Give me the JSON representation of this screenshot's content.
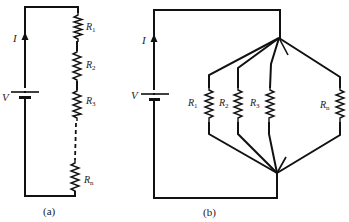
{
  "diagram": {
    "type": "circuit",
    "panels": [
      {
        "id": "a",
        "caption": "(a)",
        "configuration": "series",
        "current_label": "I",
        "voltage_label": "V",
        "resistors": [
          {
            "symbol": "R",
            "subscript": "1"
          },
          {
            "symbol": "R",
            "subscript": "2"
          },
          {
            "symbol": "R",
            "subscript": "3"
          },
          {
            "symbol": "R",
            "subscript": "n"
          }
        ]
      },
      {
        "id": "b",
        "caption": "(b)",
        "configuration": "parallel",
        "current_label": "I",
        "voltage_label": "V",
        "resistors": [
          {
            "symbol": "R",
            "subscript": "1"
          },
          {
            "symbol": "R",
            "subscript": "2"
          },
          {
            "symbol": "R",
            "subscript": "3"
          },
          {
            "symbol": "R",
            "subscript": "n"
          }
        ]
      }
    ]
  }
}
